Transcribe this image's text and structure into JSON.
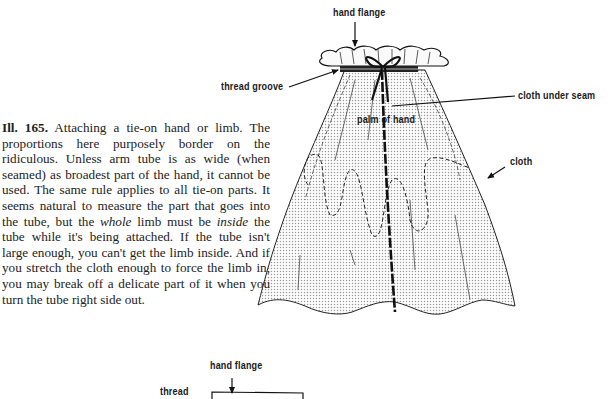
{
  "caption": {
    "figure_number": "Ill. 165.",
    "text_1": " Attaching a tie-on hand or limb. The proportions here purposely border on the ridiculous. Unless arm tube is as wide (when seamed) as broadest part of the hand, it cannot be used. The same rule applies to all tie-on parts. It seems natural to measure the part that goes into the tube, but the ",
    "italic_1": "whole",
    "text_2": " limb must be ",
    "italic_2": "inside",
    "text_3": " the tube while it's being attached. If the tube isn't large enough, you can't get the limb inside. And if you stretch the cloth enough to force the limb in, you may break off a delicate part of it when you turn the tube right side out."
  },
  "illustration_top": {
    "labels": {
      "hand_flange": "hand flange",
      "thread_groove": "thread groove",
      "cloth_under_seam": "cloth under seam",
      "palm_of_hand": "palm of hand",
      "cloth": "cloth"
    }
  },
  "illustration_bottom": {
    "labels": {
      "hand_flange": "hand flange",
      "thread": "thread"
    }
  }
}
